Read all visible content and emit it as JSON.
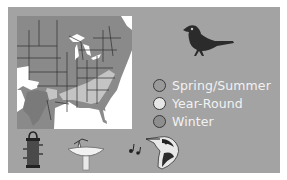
{
  "card": {
    "background": "#a3a3a3"
  },
  "map": {
    "name": "range-map-eastern-us",
    "land_color": "#8a8a8a",
    "light_region_color": "#c4c4c4",
    "water_color": "#ffffff"
  },
  "bird": {
    "icon": "songbird-silhouette-icon",
    "color": "#2b2b2b"
  },
  "legend": {
    "items": [
      {
        "label": "Spring/Summer",
        "fill": "#9a9a9a"
      },
      {
        "label": "Year-Round",
        "fill": "#e6e6e6"
      },
      {
        "label": "Winter",
        "fill": "#8e8e8e"
      }
    ]
  },
  "habitat_icons": [
    {
      "icon": "bird-feeder-icon"
    },
    {
      "icon": "birdbath-icon"
    },
    {
      "icon": "music-note-song-icon"
    },
    {
      "icon": "bird-head-icon"
    }
  ]
}
